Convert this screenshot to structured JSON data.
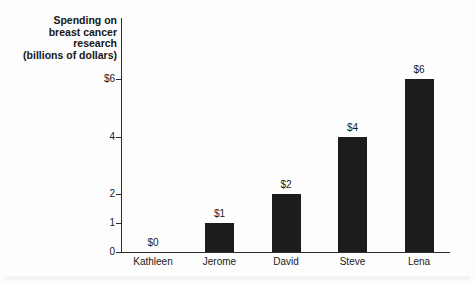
{
  "chart_data": {
    "type": "bar",
    "title": "Spending on\nbreast cancer\nresearch\n(billions of dollars)",
    "categories": [
      "Kathleen",
      "Jerome",
      "David",
      "Steve",
      "Lena"
    ],
    "values": [
      0,
      1,
      2,
      4,
      6
    ],
    "bar_value_labels": [
      "$0",
      "$1",
      "$2",
      "$4",
      "$6"
    ],
    "y_ticks": [
      {
        "value": 6,
        "label": "$6"
      },
      {
        "value": 4,
        "label": "4"
      },
      {
        "value": 2,
        "label": "2"
      },
      {
        "value": 1,
        "label": "1"
      },
      {
        "value": 0,
        "label": "0"
      }
    ],
    "ylim": [
      0,
      6.8
    ],
    "xlabel": "",
    "ylabel": "Spending on breast cancer research (billions of dollars)",
    "legend_position": "none",
    "grid": false,
    "colors": {
      "bar": "#1c1c1c",
      "axis": "#2b2b2b",
      "text": "#1a1a1a",
      "background": "#fdfdfd"
    }
  }
}
